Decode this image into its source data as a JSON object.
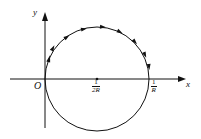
{
  "diagram": {
    "axes": {
      "x_label": "x",
      "y_label": "y",
      "origin_label": "O"
    },
    "circle": {
      "center_label": {
        "num": "1",
        "den": "2R"
      },
      "intercept_label": {
        "num": "1",
        "den": "R"
      }
    },
    "arrow_direction": "clockwise on upper half",
    "stroke_color": "#111111"
  }
}
